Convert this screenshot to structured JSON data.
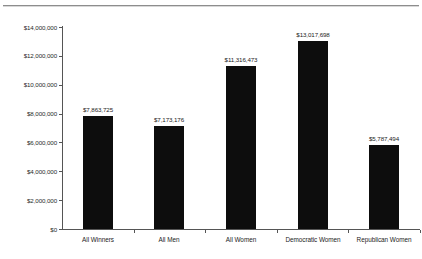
{
  "chart_data": {
    "type": "bar",
    "title": "",
    "subtitle": "",
    "xlabel": "",
    "ylabel": "",
    "categories": [
      "All Winners",
      "All Men",
      "All Women",
      "Democratic Women",
      "Republican Women"
    ],
    "values": [
      7863725,
      7173176,
      11316473,
      13017698,
      5787494
    ],
    "value_labels": [
      "$7,863,725",
      "$7,173,176",
      "$11,316,473",
      "$13,017,698",
      "$5,787,494"
    ],
    "ylim": [
      0,
      14000000
    ],
    "ytick_values": [
      0,
      2000000,
      4000000,
      6000000,
      8000000,
      10000000,
      12000000,
      14000000
    ],
    "ytick_labels": [
      "$0",
      "$2,000,000",
      "$4,000,000",
      "$6,000,000",
      "$8,000,000",
      "$10,000,000",
      "$12,000,000",
      "$14,000,000"
    ],
    "grid": false,
    "legend": null,
    "legend_position": "none",
    "bar_color": "#0d0d0d",
    "axis_color": "#555555",
    "background_color": "#ffffff",
    "data_labels_shown": true
  }
}
